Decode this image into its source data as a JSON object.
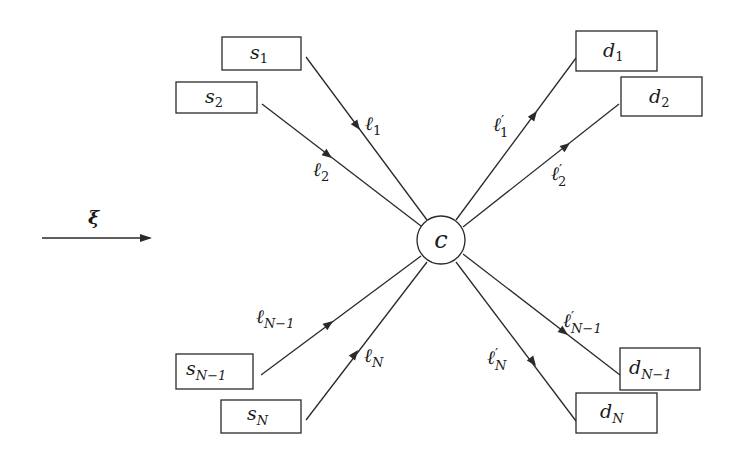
{
  "diagram": {
    "type": "star-network",
    "field": {
      "symbol": "ξ",
      "label": "xi"
    },
    "center": {
      "id": "c",
      "label": "c"
    },
    "colors": {
      "stroke": "#2a2a2a",
      "text": "#1a1a1a",
      "background": "#ffffff"
    },
    "sources": [
      {
        "id": "s1",
        "base": "s",
        "sub": "1"
      },
      {
        "id": "s2",
        "base": "s",
        "sub": "2"
      },
      {
        "id": "sN1",
        "base": "s",
        "sub": "N−1"
      },
      {
        "id": "sN",
        "base": "s",
        "sub": "N"
      }
    ],
    "destinations": [
      {
        "id": "d1",
        "base": "d",
        "sub": "1"
      },
      {
        "id": "d2",
        "base": "d",
        "sub": "2"
      },
      {
        "id": "dN1",
        "base": "d",
        "sub": "N−1"
      },
      {
        "id": "dN",
        "base": "d",
        "sub": "N"
      }
    ],
    "in_links": [
      {
        "from": "s1",
        "to": "c",
        "base": "ℓ",
        "sub": "1"
      },
      {
        "from": "s2",
        "to": "c",
        "base": "ℓ",
        "sub": "2"
      },
      {
        "from": "sN1",
        "to": "c",
        "base": "ℓ",
        "sub": "N−1"
      },
      {
        "from": "sN",
        "to": "c",
        "base": "ℓ",
        "sub": "N"
      }
    ],
    "out_links": [
      {
        "from": "c",
        "to": "d1",
        "base": "ℓ",
        "prime": "′",
        "sub": "1"
      },
      {
        "from": "c",
        "to": "d2",
        "base": "ℓ",
        "prime": "′",
        "sub": "2"
      },
      {
        "from": "c",
        "to": "dN1",
        "base": "ℓ",
        "prime": "′",
        "sub": "N−1"
      },
      {
        "from": "c",
        "to": "dN",
        "base": "ℓ",
        "prime": "′",
        "sub": "N"
      }
    ]
  }
}
